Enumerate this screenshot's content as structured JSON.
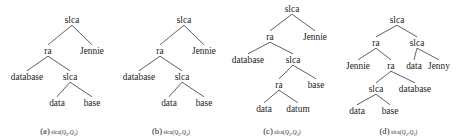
{
  "figure": {
    "background_color": "#ffffff",
    "ink_color": "#1b1b1b",
    "panel_count": 4
  },
  "panels": [
    {
      "id": "panel-a",
      "caption_tag": "(a)",
      "caption_expr_prefix": "slca(",
      "caption_q1": "Q",
      "caption_sub1": "2",
      "caption_comma": ",",
      "caption_q2": "Q",
      "caption_sub2": "2",
      "caption_expr_suffix": ")",
      "nodes": [
        {
          "name": "root",
          "label": "slca",
          "x": 72,
          "y": 22
        },
        {
          "name": "left-child",
          "label": "ra",
          "x": 48,
          "y": 53
        },
        {
          "name": "right-child",
          "label": "Jennie",
          "x": 92,
          "y": 53
        },
        {
          "name": "database-leaf",
          "label": "database",
          "x": 27,
          "y": 79
        },
        {
          "name": "inner-slca",
          "label": "slca",
          "x": 70,
          "y": 79
        },
        {
          "name": "data-leaf",
          "label": "data",
          "x": 57,
          "y": 105
        },
        {
          "name": "base-leaf",
          "label": "base",
          "x": 92,
          "y": 105
        }
      ],
      "edges": [
        {
          "from": "root",
          "to": "left-child"
        },
        {
          "from": "root",
          "to": "right-child"
        },
        {
          "from": "left-child",
          "to": "database-leaf"
        },
        {
          "from": "left-child",
          "to": "inner-slca"
        },
        {
          "from": "inner-slca",
          "to": "data-leaf"
        },
        {
          "from": "inner-slca",
          "to": "base-leaf"
        }
      ]
    },
    {
      "id": "panel-b",
      "caption_tag": "(b)",
      "caption_expr_prefix": "slca(",
      "caption_q1": "Q",
      "caption_sub1": "2",
      "caption_comma": ",",
      "caption_q2": "Q",
      "caption_sub2": "2",
      "caption_expr_suffix": ")",
      "nodes": [
        {
          "name": "root",
          "label": "slca",
          "x": 72,
          "y": 22
        },
        {
          "name": "left-child",
          "label": "ra",
          "x": 48,
          "y": 53
        },
        {
          "name": "right-child",
          "label": "Jennie",
          "x": 92,
          "y": 53
        },
        {
          "name": "database-leaf",
          "label": "database",
          "x": 27,
          "y": 79
        },
        {
          "name": "inner-slca",
          "label": "slca",
          "x": 70,
          "y": 79
        },
        {
          "name": "data-leaf",
          "label": "data",
          "x": 57,
          "y": 105
        },
        {
          "name": "base-leaf",
          "label": "base",
          "x": 92,
          "y": 105
        }
      ],
      "edges": [
        {
          "from": "root",
          "to": "left-child"
        },
        {
          "from": "root",
          "to": "right-child"
        },
        {
          "from": "left-child",
          "to": "database-leaf"
        },
        {
          "from": "left-child",
          "to": "inner-slca"
        },
        {
          "from": "inner-slca",
          "to": "data-leaf"
        },
        {
          "from": "inner-slca",
          "to": "base-leaf"
        }
      ]
    },
    {
      "id": "panel-c",
      "caption_tag": "(c)",
      "caption_expr_prefix": "slca(",
      "caption_q1": "Q",
      "caption_sub1": "2",
      "caption_comma": ",",
      "caption_q2": "Q",
      "caption_sub2": "2",
      "caption_expr_suffix": ")",
      "nodes": [
        {
          "name": "root",
          "label": "slca",
          "x": 70,
          "y": 11
        },
        {
          "name": "left-child",
          "label": "ra",
          "x": 48,
          "y": 39
        },
        {
          "name": "right-child",
          "label": "Jennie",
          "x": 93,
          "y": 39
        },
        {
          "name": "database-leaf",
          "label": "database",
          "x": 26,
          "y": 62
        },
        {
          "name": "inner-slca",
          "label": "slca",
          "x": 71,
          "y": 62
        },
        {
          "name": "inner-ra",
          "label": "ra",
          "x": 57,
          "y": 87
        },
        {
          "name": "base-leaf",
          "label": "base",
          "x": 94,
          "y": 87
        },
        {
          "name": "data-leaf",
          "label": "data",
          "x": 42,
          "y": 111
        },
        {
          "name": "datum-leaf",
          "label": "datum",
          "x": 76,
          "y": 111
        }
      ],
      "edges": [
        {
          "from": "root",
          "to": "left-child"
        },
        {
          "from": "root",
          "to": "right-child"
        },
        {
          "from": "left-child",
          "to": "database-leaf"
        },
        {
          "from": "left-child",
          "to": "inner-slca"
        },
        {
          "from": "inner-slca",
          "to": "inner-ra"
        },
        {
          "from": "inner-slca",
          "to": "base-leaf"
        },
        {
          "from": "inner-ra",
          "to": "data-leaf"
        },
        {
          "from": "inner-ra",
          "to": "datum-leaf"
        }
      ]
    },
    {
      "id": "panel-d",
      "caption_tag": "(d)",
      "caption_expr_prefix": "slca(",
      "caption_q1": "Q",
      "caption_sub1": "2",
      "caption_comma": ",",
      "caption_q2": "Q",
      "caption_sub2": "2",
      "caption_expr_suffix": ")",
      "nodes": [
        {
          "name": "root",
          "label": "slca",
          "x": 60,
          "y": 22
        },
        {
          "name": "left-ra",
          "label": "ra",
          "x": 39,
          "y": 45
        },
        {
          "name": "right-slca",
          "label": "slca",
          "x": 80,
          "y": 45
        },
        {
          "name": "jennie-leaf",
          "label": "Jennie",
          "x": 21,
          "y": 68
        },
        {
          "name": "mid-ra",
          "label": "ra",
          "x": 54,
          "y": 68
        },
        {
          "name": "data-leaf-top",
          "label": "data",
          "x": 77,
          "y": 68
        },
        {
          "name": "jenny-leaf",
          "label": "Jenny",
          "x": 102,
          "y": 68
        },
        {
          "name": "inner-slca",
          "label": "slca",
          "x": 39,
          "y": 91
        },
        {
          "name": "database-leaf",
          "label": "database",
          "x": 78,
          "y": 91
        },
        {
          "name": "data-leaf-bottom",
          "label": "data",
          "x": 20,
          "y": 113
        },
        {
          "name": "base-leaf",
          "label": "base",
          "x": 53,
          "y": 113
        }
      ],
      "edges": [
        {
          "from": "root",
          "to": "left-ra"
        },
        {
          "from": "root",
          "to": "right-slca"
        },
        {
          "from": "left-ra",
          "to": "jennie-leaf"
        },
        {
          "from": "left-ra",
          "to": "mid-ra"
        },
        {
          "from": "right-slca",
          "to": "data-leaf-top"
        },
        {
          "from": "right-slca",
          "to": "jenny-leaf"
        },
        {
          "from": "mid-ra",
          "to": "inner-slca"
        },
        {
          "from": "mid-ra",
          "to": "database-leaf"
        },
        {
          "from": "inner-slca",
          "to": "data-leaf-bottom"
        },
        {
          "from": "inner-slca",
          "to": "base-leaf"
        }
      ]
    }
  ],
  "panel_geometry": [
    {
      "left": 0,
      "width": 118
    },
    {
      "left": 112,
      "width": 118
    },
    {
      "left": 222,
      "width": 120
    },
    {
      "left": 337,
      "width": 123
    }
  ]
}
